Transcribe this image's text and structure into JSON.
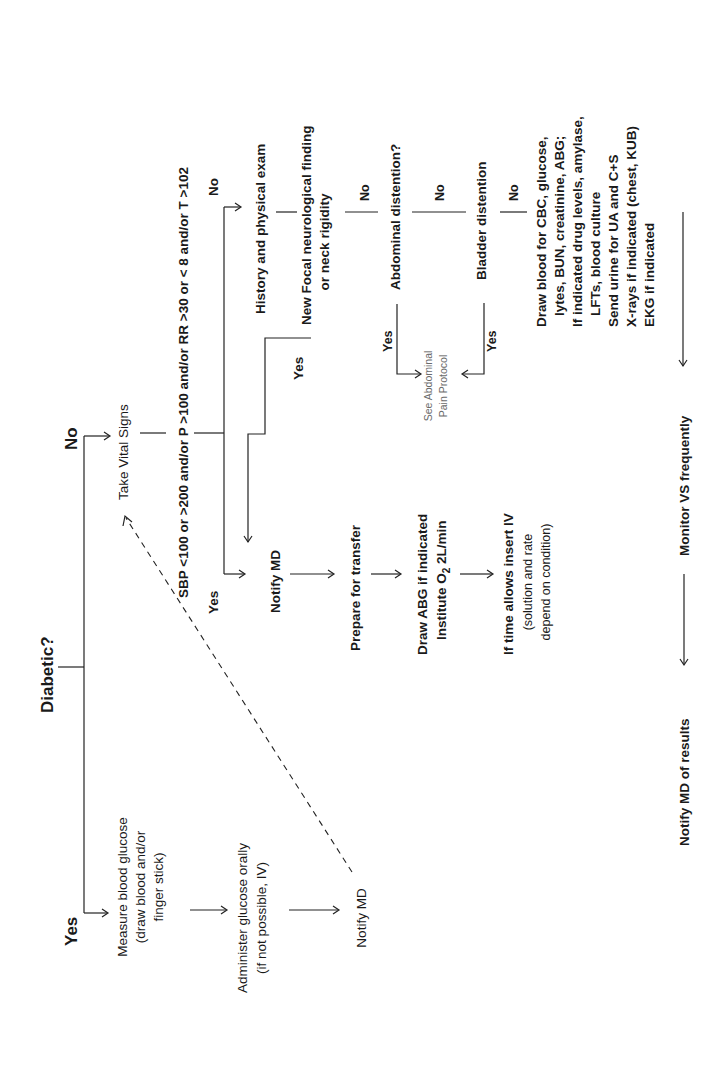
{
  "diagram": {
    "orientation": "rotated-90-ccw",
    "root_question": "Diabetic?",
    "yes_branch": {
      "label": "Yes",
      "steps": [
        {
          "line1": "Measure blood glucose",
          "line2": "(draw blood and/or",
          "line3": "finger stick)"
        },
        {
          "line1": "Administer glucose orally",
          "line2": "(if not possible, IV)"
        },
        {
          "line1": "Notify MD"
        }
      ]
    },
    "no_branch": {
      "label": "No",
      "take_vitals": "Take Vital Signs",
      "vitals_criteria": "SBP <100 or >200 and/or P >100 and/or RR >30 or < 8 and/or T >102",
      "criteria_yes": "Yes",
      "criteria_no": "No",
      "history_exam": "History and physical exam",
      "neuro_question": {
        "line1": "New Focal neurological finding",
        "line2": "or neck rigidity"
      },
      "neuro_yes": "Yes",
      "neuro_no": "No",
      "abdominal_question": "Abdominal distention?",
      "abdominal_yes": "Yes",
      "abdominal_no": "No",
      "bladder_question": "Bladder distention",
      "bladder_yes": "Yes",
      "bladder_no": "No",
      "see_protocol": {
        "line1": "See Abdominal",
        "line2": "Pain Protocol"
      },
      "workup": {
        "lines": [
          "Draw blood for CBC, glucose,",
          "lytes, BUN, creatinine, ABG;",
          "If indicated drug levels, amylase,",
          "LFTs, blood culture",
          "Send urine for UA and C+S",
          "X-rays if indicated (chest, KUB)",
          "EKG if indicated"
        ]
      },
      "monitor": "Monitor VS frequently",
      "notify_results": "Notify MD of results",
      "emergency_path": {
        "notify": "Notify MD",
        "prepare": "Prepare for transfer",
        "abg_line1": "Draw ABG if indicated",
        "abg_line2_prefix": "Institute O",
        "abg_line2_sub": "2",
        "abg_line2_suffix": " 2L/min",
        "iv_line1": "If time allows insert IV",
        "iv_line2": "(solution and rate",
        "iv_line3": "depend on condition)"
      }
    }
  }
}
